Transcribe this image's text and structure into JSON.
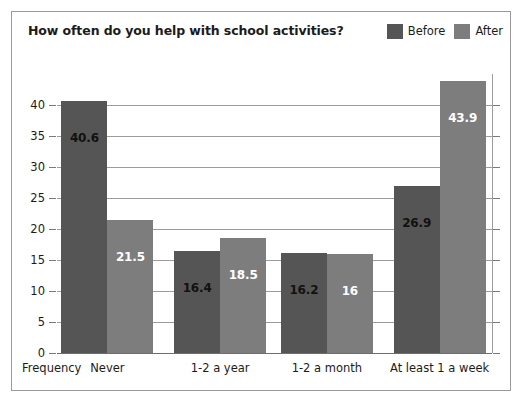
{
  "chart_data": {
    "type": "bar",
    "title": "How often do you help with school activities?",
    "xlabel": "Frequency",
    "ylabel": "",
    "categories": [
      "Never",
      "1-2 a year",
      "1-2 a month",
      "At least 1 a week"
    ],
    "series": [
      {
        "name": "Before",
        "color": "#555555",
        "values": [
          40.6,
          16.4,
          16.2,
          26.9
        ],
        "value_labels": [
          "40.6",
          "16.4",
          "16.2",
          "26.9"
        ]
      },
      {
        "name": "After",
        "color": "#7d7d7d",
        "values": [
          21.5,
          18.5,
          16,
          43.9
        ],
        "value_labels": [
          "21.5",
          "18.5",
          "16",
          "43.9"
        ]
      }
    ],
    "ylim": [
      0,
      45
    ],
    "yticks": [
      0,
      5,
      10,
      15,
      20,
      25,
      30,
      35,
      40
    ],
    "ytick_labels": [
      "0",
      "5",
      "10",
      "15",
      "20",
      "25",
      "30",
      "35",
      "40"
    ],
    "grid": true,
    "legend_position": "top-right"
  },
  "legend": {
    "entries": [
      {
        "label": "Before",
        "color": "#555555"
      },
      {
        "label": "After",
        "color": "#7d7d7d"
      }
    ]
  }
}
